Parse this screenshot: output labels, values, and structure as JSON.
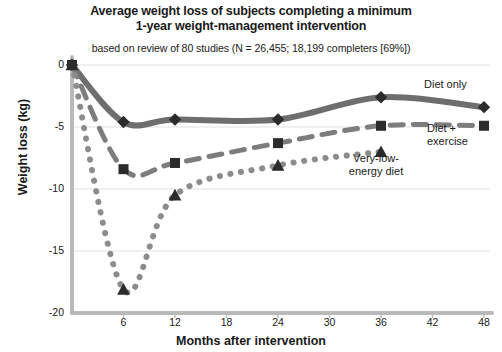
{
  "chart_data": {
    "type": "line",
    "title": "Average weight loss of subjects completing a minimum 1-year weight-management intervention",
    "subtitle": "based on review of 80 studies (N = 26,455; 18,199 completers [69%])",
    "xlabel": "Months after intervention",
    "ylabel": "Weight loss (kg)",
    "xlim": [
      0,
      48
    ],
    "ylim": [
      -20,
      0
    ],
    "xticks": [
      6,
      12,
      18,
      24,
      30,
      36,
      42,
      48
    ],
    "yticks": [
      0,
      -5,
      -10,
      -15,
      -20
    ],
    "ytick_labels": [
      "0",
      "-5",
      "-10",
      "-15",
      "-20"
    ],
    "grid": "horizontal",
    "legend": "inline-annotations",
    "series": [
      {
        "name": "Diet only",
        "marker": "diamond",
        "line_style": "solid",
        "color": "#6e6e6e",
        "marker_color": "#2b2b2b",
        "x": [
          0,
          6,
          12,
          24,
          36,
          48
        ],
        "y": [
          0,
          -4.6,
          -4.4,
          -4.4,
          -2.6,
          -3.4
        ]
      },
      {
        "name": "Diet + exercise",
        "marker": "square",
        "line_style": "dashed",
        "color": "#7d7d7d",
        "marker_color": "#2b2b2b",
        "x": [
          0,
          6,
          12,
          24,
          36,
          48
        ],
        "y": [
          0,
          -8.4,
          -7.9,
          -6.3,
          -4.9,
          -4.9
        ]
      },
      {
        "name": "Very-low-energy diet",
        "marker": "triangle",
        "line_style": "dotted",
        "color": "#8c8c8c",
        "marker_color": "#2b2b2b",
        "x": [
          0,
          6,
          12,
          24,
          36
        ],
        "y": [
          0,
          -18.1,
          -10.5,
          -8.1,
          -7.0
        ]
      }
    ],
    "annotations": [
      {
        "text": "Diet only",
        "series": "Diet only"
      },
      {
        "text": "Diet + exercise",
        "series": "Diet + exercise"
      },
      {
        "text": "Very-low-energy diet",
        "series": "Very-low-energy diet"
      }
    ],
    "axis_color": "#b9b9b9",
    "grid_color": "#eceaea"
  },
  "labels": {
    "diet_only": "Diet only",
    "diet_exercise_line1": "Diet +",
    "diet_exercise_line2": "exercise",
    "vled_line1": "Very-low-",
    "vled_line2": "energy diet"
  }
}
